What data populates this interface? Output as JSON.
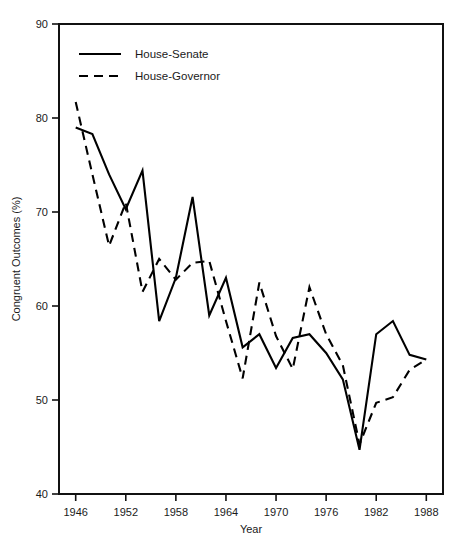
{
  "chart_data": {
    "type": "line",
    "title": "",
    "subtitle": "",
    "xlabel": "Year",
    "ylabel": "Congruent Outcomes (%)",
    "xlim": [
      1944,
      1990
    ],
    "ylim": [
      40,
      90
    ],
    "grid": false,
    "legend_position": "top-left",
    "xticks": [
      1946,
      1952,
      1958,
      1964,
      1970,
      1976,
      1982,
      1988
    ],
    "xtick_labels": [
      "1946",
      "1952",
      "1958",
      "1964",
      "1970",
      "1976",
      "1982",
      "1988"
    ],
    "yticks": [
      40,
      50,
      60,
      70,
      80,
      90
    ],
    "ytick_labels": [
      "40",
      "50",
      "60",
      "70",
      "80",
      "90"
    ],
    "x": [
      1946,
      1948,
      1950,
      1952,
      1954,
      1956,
      1958,
      1960,
      1962,
      1964,
      1966,
      1968,
      1970,
      1972,
      1974,
      1976,
      1978,
      1980,
      1982,
      1984,
      1986,
      1988
    ],
    "series": [
      {
        "name": "House-Senate",
        "style": "solid",
        "color": "#000000",
        "values": [
          79.0,
          78.3,
          74.0,
          70.3,
          74.4,
          58.4,
          63.0,
          71.6,
          59.0,
          63.0,
          55.6,
          57.0,
          53.4,
          56.6,
          57.0,
          55.0,
          52.2,
          44.7,
          57.0,
          58.4,
          54.8,
          54.3
        ]
      },
      {
        "name": "House-Governor",
        "style": "dashed",
        "color": "#000000",
        "values": [
          81.7,
          74.0,
          66.4,
          71.0,
          61.5,
          65.0,
          62.8,
          64.6,
          64.8,
          58.4,
          52.3,
          62.5,
          56.8,
          53.3,
          62.0,
          57.0,
          53.7,
          45.3,
          49.7,
          50.3,
          53.2,
          54.3
        ]
      }
    ]
  },
  "legend": {
    "entries": [
      {
        "label": "House-Senate",
        "style": "solid"
      },
      {
        "label": "House-Governor",
        "style": "dashed"
      }
    ]
  }
}
